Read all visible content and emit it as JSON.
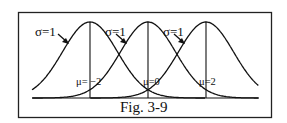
{
  "figure": {
    "caption": "Fig. 3-9",
    "frame_color": "#222222",
    "curve_color": "#111111",
    "curves": [
      {
        "sigma_label": "σ=1",
        "mu_label": "μ= −2",
        "mu": -2,
        "sigma": 1
      },
      {
        "sigma_label": "σ=1",
        "mu_label": "μ=0",
        "mu": 0,
        "sigma": 1
      },
      {
        "sigma_label": "σ=1",
        "mu_label": "μ=2",
        "mu": 2,
        "sigma": 1
      }
    ]
  },
  "chart_data": {
    "type": "line",
    "title": "Fig. 3-9",
    "series": [
      {
        "name": "σ=1, μ=−2",
        "mean": -2,
        "sd": 1
      },
      {
        "name": "σ=1, μ=0",
        "mean": 0,
        "sd": 1
      },
      {
        "name": "σ=1, μ=2",
        "mean": 2,
        "sd": 1
      }
    ],
    "xlabel": "",
    "ylabel": "",
    "grid": false
  }
}
